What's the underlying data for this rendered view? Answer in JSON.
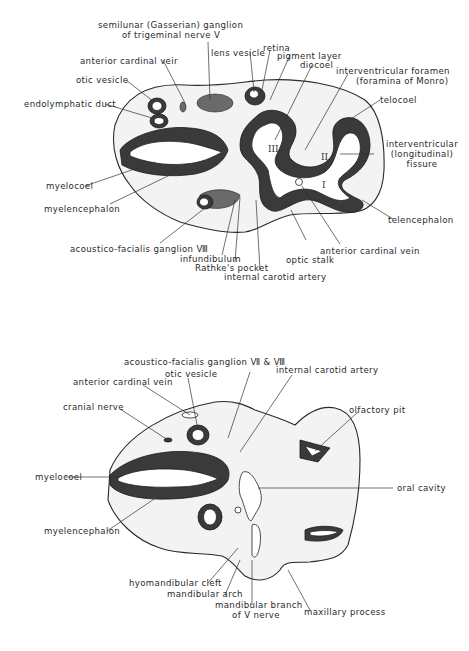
{
  "figure": {
    "upper_section": {
      "labels": {
        "semilunar_1": "semilunar (Gasserian) ganglion",
        "semilunar_2": "of trigeminal nerve Ⅴ",
        "lens_vesicle": "lens vesicle",
        "retina": "retina",
        "pigment_layer": "pigment layer",
        "diocoel": "diocoel",
        "anterior_cardinal_vein_top": "anterior cardinal veir",
        "otic_vesicle": "otic vesicle",
        "endolymphatic_duct": "endolymphatic duct",
        "interventricular_foramen_1": "interventricular foramen",
        "interventricular_foramen_2": "(foramina of Monro)",
        "telocoel": "telocoel",
        "interventricular_fissure_1": "interventricular",
        "interventricular_fissure_2": "(longitudinal)",
        "interventricular_fissure_3": "fissure",
        "myelocoel": "myelocoel",
        "myelencephalon": "myelencephalon",
        "telencephalon": "telencephalon",
        "acoustico_facialis": "acoustico-facialis ganglion Ⅷ",
        "infundibulum": "infundibulum",
        "rathkes_pocket": "Rathke's pocket",
        "internal_carotid_artery": "internal carotid artery",
        "optic_stalk": "optic stalk",
        "anterior_cardinal_vein_bottom": "anterior cardinal vein"
      },
      "numerals": {
        "ventricle_1": "I",
        "ventricle_2": "II",
        "ventricle_3": "III"
      }
    },
    "lower_section": {
      "labels": {
        "acoustico_facialis": "acoustico-facialis ganglion Ⅶ & Ⅷ",
        "otic_vesicle": "otic vesicle",
        "anterior_cardinal_vein": "anterior cardinal vein",
        "internal_carotid_artery": "internal carotid artery",
        "cranial_nerve": "cranial nerve",
        "olfactory_pit": "olfactory pit",
        "myelocoel": "myelocoel",
        "oral_cavity": "oral cavity",
        "myelencephalon": "myelencephalon",
        "hyomandibular_cleft": "hyomandibular cleft",
        "mandibular_arch": "mandibular arch",
        "mandibular_branch_1": "mandibular branch",
        "mandibular_branch_2": "of Ⅴ nerve",
        "maxillary_process": "maxillary process"
      }
    }
  }
}
